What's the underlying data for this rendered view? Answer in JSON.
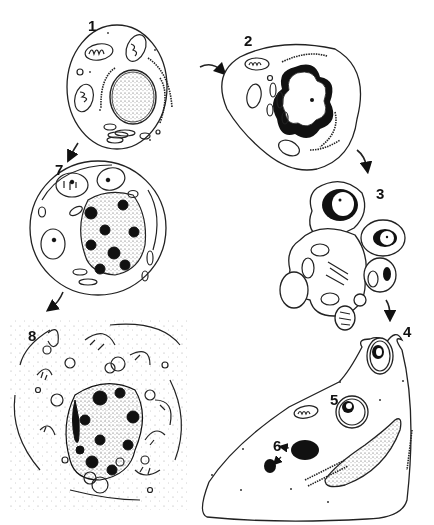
{
  "diagram": {
    "type": "cell-death-sequence",
    "labels": {
      "stage1": "1",
      "stage2": "2",
      "stage3": "3",
      "stage4": "4",
      "stage5": "5",
      "stage6": "6",
      "stage7": "7",
      "stage8": "8"
    },
    "colors": {
      "line": "#222222",
      "fill": "#ffffff",
      "chromatin": "#111111"
    },
    "flows": [
      {
        "from": "1",
        "to": "2"
      },
      {
        "from": "2",
        "to": "3"
      },
      {
        "from": "3",
        "to": "4"
      },
      {
        "from": "1",
        "to": "7"
      },
      {
        "from": "7",
        "to": "8"
      }
    ]
  }
}
